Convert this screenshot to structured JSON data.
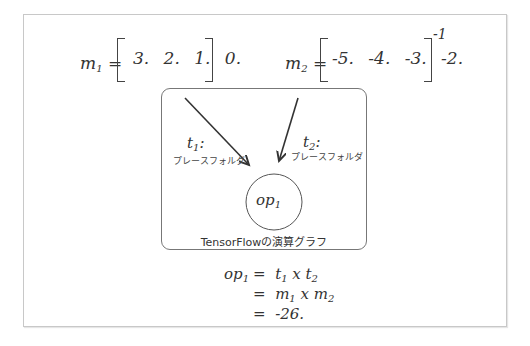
{
  "equations": {
    "m1": {
      "name": "m",
      "sub": "1",
      "equals": "=",
      "values": "3.  2.  1.  0."
    },
    "m2": {
      "name": "m",
      "sub": "2",
      "equals": "=",
      "values": "-5.  -4.  -3.  -2.",
      "superscript": "-1"
    }
  },
  "graph": {
    "t1": {
      "name": "t",
      "sub": "1",
      "colon": ":",
      "desc": "プレースフォルダ"
    },
    "t2": {
      "name": "t",
      "sub": "2",
      "colon": ":",
      "desc": "プレースフォルダ"
    },
    "op": {
      "name": "op",
      "sub": "1"
    },
    "caption": "TensorFlowの演算グラフ"
  },
  "result": {
    "lhs_name": "op",
    "lhs_sub": "1",
    "line1": {
      "eq": "=",
      "a": "t",
      "a_sub": "1",
      "op": "x",
      "b": "t",
      "b_sub": "2"
    },
    "line2": {
      "eq": "=",
      "a": "m",
      "a_sub": "1",
      "op": "x",
      "b": "m",
      "b_sub": "2"
    },
    "line3": {
      "eq": "=",
      "value": "-26."
    }
  }
}
